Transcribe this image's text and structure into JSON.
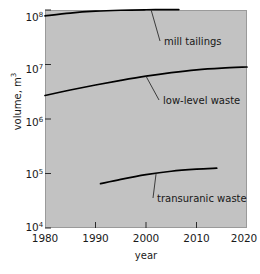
{
  "chart_data": {
    "type": "line",
    "title": "",
    "xlabel": "year",
    "ylabel": "volume, m",
    "ylabel_exponent": "3",
    "xlim": [
      1980,
      2020
    ],
    "ylim": [
      10000,
      100000000
    ],
    "yscale": "log",
    "xscale": "linear",
    "grid": false,
    "legend_position": "inline-annotations",
    "background_color": "#c2c2c2",
    "line_color": "#000000",
    "xticks": [
      {
        "value": 1980,
        "label": "1980"
      },
      {
        "value": 1990,
        "label": "1990"
      },
      {
        "value": 2000,
        "label": "2000"
      },
      {
        "value": 2010,
        "label": "2010"
      },
      {
        "value": 2020,
        "label": "2020"
      }
    ],
    "yticks": [
      {
        "value": 100000000,
        "mantissa": "10",
        "exponent": "8"
      },
      {
        "value": 10000000,
        "mantissa": "10",
        "exponent": "7"
      },
      {
        "value": 1000000,
        "mantissa": "10",
        "exponent": "6"
      },
      {
        "value": 100000,
        "mantissa": "10",
        "exponent": "5"
      },
      {
        "value": 10000,
        "mantissa": "10",
        "exponent": "4"
      }
    ],
    "series": [
      {
        "name": "mill tailings",
        "label": "mill tailings",
        "x": [
          1980,
          1985,
          1990,
          1995,
          2000,
          2003,
          2006.5
        ],
        "values": [
          78000000,
          88000000,
          95000000,
          99000000,
          101000000,
          101500000,
          102000000
        ]
      },
      {
        "name": "low-level waste",
        "label": "low-level waste",
        "x": [
          1980,
          1985,
          1990,
          1995,
          2000,
          2005,
          2010,
          2015,
          2020
        ],
        "values": [
          2700000,
          3400000,
          4200000,
          5100000,
          6100000,
          7100000,
          8000000,
          8600000,
          9000000
        ]
      },
      {
        "name": "transuranic waste",
        "label": "transuranic waste",
        "x": [
          1991,
          1995,
          2000,
          2005,
          2010,
          2014
        ],
        "values": [
          65000,
          78000,
          95000,
          110000,
          120000,
          125000
        ]
      }
    ],
    "annotations": [
      {
        "text": "mill tailings",
        "target_x": 2001,
        "target_y": 101200000,
        "label_x": 164,
        "label_y": 36
      },
      {
        "text": "low-level waste",
        "target_x": 2000,
        "target_y": 6100000,
        "label_x": 163,
        "label_y": 95
      },
      {
        "text": "transuranic waste",
        "target_x": 2002,
        "target_y": 100000,
        "label_x": 157,
        "label_y": 193
      }
    ]
  }
}
